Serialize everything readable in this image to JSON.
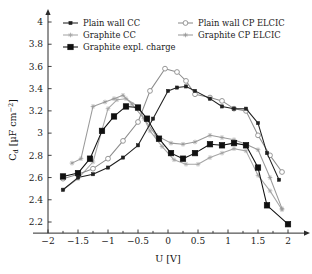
{
  "chart_data": {
    "type": "line",
    "title": "",
    "xlabel": "U [V]",
    "ylabel": "C_d [µF cm⁻²]",
    "ylabel_parts": {
      "symbol": "C",
      "subscript": "d",
      "units": "[µF cm",
      "exponent": "−2",
      "close": "]"
    },
    "xlim": [
      -2.25,
      2.3
    ],
    "ylim": [
      2.1,
      4.08
    ],
    "xticks": [
      -2,
      -1.5,
      -1,
      -0.5,
      0,
      0.5,
      1,
      1.5,
      2
    ],
    "xtick_labels": [
      "−2",
      "−1.5",
      "−1",
      "−0.5",
      "0",
      "0.5",
      "1",
      "1.5",
      "2"
    ],
    "xminorticks": [
      -1.75,
      -1.25,
      -0.75,
      -0.25,
      0.25,
      0.75,
      1.25,
      1.75
    ],
    "yticks": [
      2.2,
      2.4,
      2.6,
      2.8,
      3.0,
      3.2,
      3.4,
      3.6,
      3.8,
      4.0
    ],
    "ytick_labels": [
      "2.2",
      "2.4",
      "2.6",
      "2.8",
      "3",
      "3.2",
      "3.4",
      "3.6",
      "3.8",
      "4"
    ],
    "grid": false,
    "legend_position": "top-inside",
    "series": [
      {
        "name": "Plain wall CC",
        "color": "#1f1f1f",
        "marker": "triangle-small",
        "marker_fill": "#1f1f1f",
        "x": [
          -1.75,
          -1.5,
          -1.25,
          -1.0,
          -0.75,
          -0.5,
          -0.25,
          0.0,
          0.15,
          0.3,
          0.45,
          0.7,
          0.9,
          1.1,
          1.3,
          1.5,
          1.65,
          1.85
        ],
        "y": [
          2.49,
          2.6,
          2.63,
          2.69,
          2.78,
          2.89,
          3.13,
          3.38,
          3.41,
          3.42,
          3.38,
          3.31,
          3.24,
          3.22,
          3.22,
          3.09,
          2.82,
          2.58
        ]
      },
      {
        "name": "Plain wall CP ELCIC",
        "color": "#8c8c8c",
        "marker": "circle-open",
        "marker_fill": "#ffffff",
        "x": [
          -1.75,
          -1.5,
          -1.25,
          -1.0,
          -0.75,
          -0.5,
          -0.3,
          -0.05,
          0.15,
          0.3,
          0.45,
          0.7,
          0.9,
          1.1,
          1.3,
          1.5,
          1.7,
          1.9
        ],
        "y": [
          2.59,
          2.63,
          2.68,
          2.77,
          2.93,
          3.1,
          3.38,
          3.58,
          3.55,
          3.47,
          3.35,
          3.32,
          3.29,
          3.22,
          3.2,
          2.98,
          2.8,
          2.65
        ]
      },
      {
        "name": "Graphite CC",
        "color": "#a6a6a6",
        "marker": "star-small",
        "marker_fill": "#a6a6a6",
        "x": [
          -1.75,
          -1.5,
          -1.25,
          -1.0,
          -0.85,
          -0.7,
          -0.5,
          -0.3,
          -0.1,
          0.1,
          0.3,
          0.5,
          0.7,
          0.9,
          1.1,
          1.3,
          1.5,
          1.7,
          1.9
        ],
        "y": [
          2.49,
          2.59,
          2.74,
          3.22,
          3.3,
          3.31,
          3.24,
          3.02,
          2.88,
          2.76,
          2.72,
          2.72,
          2.78,
          2.82,
          2.86,
          2.84,
          2.62,
          2.48,
          2.31
        ]
      },
      {
        "name": "Graphite CP ELCIC",
        "color": "#9a9a9a",
        "marker": "star-small",
        "marker_fill": "#9a9a9a",
        "x": [
          -1.6,
          -1.45,
          -1.25,
          -1.05,
          -0.9,
          -0.75,
          -0.6,
          -0.4,
          -0.2,
          0.05,
          0.25,
          0.45,
          0.7,
          0.9,
          1.1,
          1.3,
          1.5,
          1.7,
          1.9
        ],
        "y": [
          2.73,
          2.77,
          3.24,
          3.28,
          3.31,
          3.34,
          3.26,
          3.13,
          2.98,
          2.91,
          2.9,
          2.92,
          2.98,
          2.96,
          2.94,
          2.9,
          2.85,
          2.6,
          2.32
        ]
      },
      {
        "name": "Graphite expl. charge",
        "color": "#101010",
        "marker": "square-filled",
        "marker_fill": "#101010",
        "x": [
          -1.75,
          -1.5,
          -1.3,
          -1.1,
          -0.9,
          -0.7,
          -0.5,
          -0.35,
          -0.15,
          0.05,
          0.25,
          0.45,
          0.7,
          0.9,
          1.1,
          1.3,
          1.5,
          1.65,
          2.0
        ],
        "y": [
          2.61,
          2.64,
          2.77,
          3.02,
          3.15,
          3.24,
          3.23,
          3.13,
          2.95,
          2.82,
          2.77,
          2.82,
          2.9,
          2.89,
          2.91,
          2.89,
          2.69,
          2.35,
          2.18
        ]
      }
    ]
  },
  "legend": {
    "entries": [
      {
        "label": "Plain wall CC",
        "key": "plain-wall-cc"
      },
      {
        "label": "Plain wall CP ELCIC",
        "key": "plain-wall-cp-elcic"
      },
      {
        "label": "Graphite CC",
        "key": "graphite-cc"
      },
      {
        "label": "Graphite CP ELCIC",
        "key": "graphite-cp-elcic"
      },
      {
        "label": "Graphite expl. charge",
        "key": "graphite-expl-charge"
      }
    ]
  }
}
